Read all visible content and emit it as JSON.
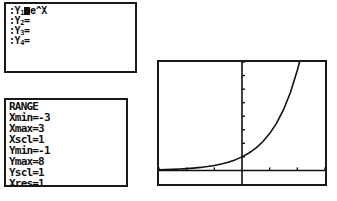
{
  "device": {
    "kind": "graphing-calculator-screens"
  },
  "y_editor": {
    "name": "Y= editor",
    "lines": [
      {
        "prompt": ":",
        "label": "Y",
        "index": "1",
        "equals": "cursor-block",
        "expression": "e^X"
      },
      {
        "prompt": ":",
        "label": "Y",
        "index": "2",
        "equals": "=",
        "expression": ""
      },
      {
        "prompt": ":",
        "label": "Y",
        "index": "3",
        "equals": "=",
        "expression": ""
      },
      {
        "prompt": ":",
        "label": "Y",
        "index": "4",
        "equals": "=",
        "expression": ""
      }
    ],
    "line_texts": [
      ":Y1 e^X",
      ":Y2=",
      ":Y3=",
      ":Y4="
    ]
  },
  "range_editor": {
    "title": "RANGE",
    "entries": [
      {
        "key": "Xmin",
        "value": "-3",
        "text": "Xmin=-3"
      },
      {
        "key": "Xmax",
        "value": "3",
        "text": "Xmax=3"
      },
      {
        "key": "Xscl",
        "value": "1",
        "text": "Xscl=1"
      },
      {
        "key": "Ymin",
        "value": "-1",
        "text": "Ymin=-1"
      },
      {
        "key": "Ymax",
        "value": "8",
        "text": "Ymax=8"
      },
      {
        "key": "Yscl",
        "value": "1",
        "text": "Yscl=1"
      },
      {
        "key": "Xres",
        "value": "1",
        "text": "Xres=1"
      }
    ]
  },
  "chart_data": {
    "type": "line",
    "title": "",
    "xlabel": "",
    "ylabel": "",
    "xlim": [
      -3,
      3
    ],
    "ylim": [
      -1,
      8
    ],
    "xscl": 1,
    "yscl": 1,
    "grid": false,
    "legend": null,
    "axes": {
      "x_axis_at_y": 0,
      "y_axis_at_x": 0,
      "tick_length_px": 3,
      "x_ticks": [
        -3,
        -2,
        -1,
        1,
        2,
        3
      ],
      "y_ticks": [
        1,
        2,
        3,
        4,
        5,
        6,
        7,
        8
      ]
    },
    "series": [
      {
        "name": "Y1 = e^X",
        "expression": "e^x",
        "x": [
          -3,
          -2.75,
          -2.5,
          -2.25,
          -2,
          -1.75,
          -1.5,
          -1.25,
          -1,
          -0.75,
          -0.5,
          -0.25,
          0,
          0.25,
          0.5,
          0.75,
          1,
          1.25,
          1.5,
          1.75,
          2,
          2.0794
        ],
        "values": [
          0.0498,
          0.0639,
          0.0821,
          0.1054,
          0.1353,
          0.1738,
          0.2231,
          0.2865,
          0.3679,
          0.4724,
          0.6065,
          0.7788,
          1.0,
          1.284,
          1.6487,
          2.117,
          2.7183,
          3.4903,
          4.4817,
          5.7546,
          7.3891,
          8.0
        ]
      }
    ]
  }
}
